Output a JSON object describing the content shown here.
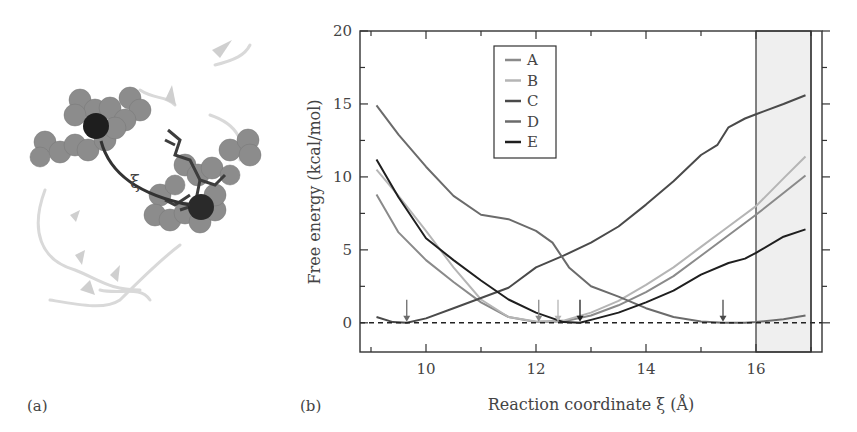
{
  "panels": {
    "a_label": "(a)",
    "b_label": "(b)"
  },
  "molecule": {
    "distance_symbol": "ξ"
  },
  "chart_data": {
    "type": "line",
    "title": "",
    "xlabel": "Reaction coordinate ξ (Å)",
    "ylabel": "Free energy (kcal/mol)",
    "xlim": [
      8.8,
      17.2
    ],
    "ylim": [
      -2,
      20
    ],
    "xticks": [
      10,
      12,
      14,
      16
    ],
    "yticks": [
      0,
      5,
      10,
      15,
      20
    ],
    "grid": false,
    "legend_position": "upper-left-center",
    "shaded_region": {
      "x_from": 16,
      "x_to": 17,
      "color": "#efefef"
    },
    "reference_line": {
      "y": 0,
      "style": "dashed"
    },
    "minimum_arrows": [
      {
        "x": 9.65,
        "series": "D"
      },
      {
        "x": 12.05,
        "series": "A"
      },
      {
        "x": 12.4,
        "series": "B"
      },
      {
        "x": 12.8,
        "series": "E"
      },
      {
        "x": 15.4,
        "series": "C"
      }
    ],
    "series": [
      {
        "name": "A",
        "color": "#8a8a8a",
        "width": 2,
        "x": [
          9.1,
          9.5,
          10,
          10.5,
          11,
          11.5,
          12,
          12.5,
          13,
          13.5,
          14,
          14.5,
          15,
          15.5,
          16,
          16.5,
          16.9
        ],
        "y": [
          8.8,
          6.2,
          4.3,
          2.8,
          1.4,
          0.4,
          0.05,
          0.1,
          0.5,
          1.2,
          2.1,
          3.2,
          4.6,
          6.0,
          7.4,
          8.9,
          10.1
        ]
      },
      {
        "name": "B",
        "color": "#b5b5b5",
        "width": 2,
        "x": [
          9.1,
          9.5,
          10,
          10.5,
          11,
          11.5,
          12,
          12.5,
          13,
          13.5,
          14,
          14.5,
          15,
          15.5,
          16,
          16.5,
          16.9
        ],
        "y": [
          10.5,
          8.7,
          6.3,
          3.8,
          1.6,
          0.4,
          0.1,
          0.15,
          0.7,
          1.5,
          2.6,
          3.8,
          5.2,
          6.6,
          8.0,
          9.9,
          11.4
        ]
      },
      {
        "name": "C",
        "color": "#4a4a4a",
        "width": 2,
        "x": [
          9.1,
          9.4,
          9.65,
          10,
          10.5,
          11,
          11.5,
          12,
          12.5,
          13,
          13.5,
          14,
          14.5,
          15,
          15.3,
          15.5,
          15.8,
          16,
          16.5,
          16.9
        ],
        "y": [
          0.4,
          0.05,
          0.0,
          0.3,
          1.0,
          1.7,
          2.4,
          3.8,
          4.6,
          5.5,
          6.6,
          8.1,
          9.7,
          11.5,
          12.2,
          13.4,
          14.0,
          14.3,
          15.0,
          15.6
        ]
      },
      {
        "name": "D",
        "color": "#6b6b6b",
        "width": 2,
        "x": [
          9.1,
          9.5,
          10,
          10.5,
          11,
          11.5,
          12,
          12.3,
          12.6,
          13,
          13.5,
          14,
          14.5,
          15,
          15.4,
          15.8,
          16,
          16.5,
          16.9
        ],
        "y": [
          14.9,
          12.9,
          10.7,
          8.7,
          7.4,
          7.1,
          6.3,
          5.5,
          3.8,
          2.5,
          1.8,
          1.0,
          0.4,
          0.1,
          0.0,
          0.0,
          0.05,
          0.25,
          0.5
        ]
      },
      {
        "name": "E",
        "color": "#1f1f1f",
        "width": 2,
        "x": [
          9.1,
          9.5,
          10,
          10.5,
          11,
          11.5,
          12,
          12.5,
          12.8,
          13,
          13.5,
          14,
          14.5,
          15,
          15.5,
          15.8,
          16,
          16.5,
          16.9
        ],
        "y": [
          11.2,
          8.6,
          5.8,
          4.3,
          2.9,
          1.6,
          0.7,
          0.05,
          0.0,
          0.2,
          0.7,
          1.4,
          2.2,
          3.3,
          4.1,
          4.4,
          4.8,
          5.9,
          6.4
        ]
      }
    ]
  }
}
